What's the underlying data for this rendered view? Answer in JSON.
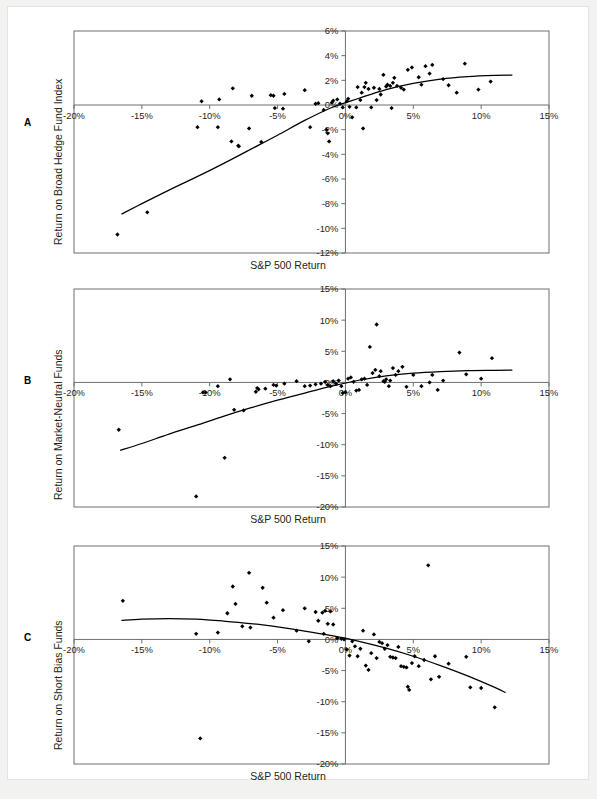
{
  "figure": {
    "background": "#f2f2f1",
    "page_background": "#ffffff",
    "axis_color": "#6d6e71",
    "curve_color": "#000000",
    "point_color": "#000000"
  },
  "panels": [
    {
      "letter": "A",
      "ylabel": "Return on Broad Hedge Fund Index",
      "xlabel": "S&P 500 Return"
    },
    {
      "letter": "B",
      "ylabel": "Return on Market-Neutral Funds",
      "xlabel": "S&P 500 Return"
    },
    {
      "letter": "C",
      "ylabel": "Return on Short Bias Funds",
      "xlabel": "S&P 500 Return"
    }
  ],
  "chart_data": [
    {
      "type": "scatter",
      "panel": "A",
      "title": "",
      "xlabel": "S&P 500 Return",
      "ylabel": "Return on Broad Hedge Fund Index",
      "xlim": [
        -20,
        15
      ],
      "ylim": [
        -12,
        6
      ],
      "xticks": [
        -20,
        -15,
        -10,
        -5,
        0,
        5,
        10,
        15
      ],
      "xticklabels": [
        "-20%",
        "-15%",
        "-10%",
        "-5%",
        "0%",
        "5%",
        "10%",
        "15%"
      ],
      "yticks": [
        6,
        4,
        2,
        0,
        -2,
        -4,
        -6,
        -8,
        -10,
        -12
      ],
      "yticklabels": [
        "6%",
        "4%",
        "2%",
        "0%",
        "-2%",
        "-4%",
        "-6%",
        "-8%",
        "-10%",
        "-12%"
      ],
      "grid": false,
      "legend": null,
      "points": [
        [
          -16.8,
          -10.5
        ],
        [
          -14.6,
          -8.7
        ],
        [
          -10.9,
          -1.8
        ],
        [
          -10.6,
          0.3
        ],
        [
          -9.4,
          -1.8
        ],
        [
          -9.3,
          0.45
        ],
        [
          -8.4,
          -2.95
        ],
        [
          -8.3,
          1.35
        ],
        [
          -7.9,
          -3.3
        ],
        [
          -7.85,
          -3.35
        ],
        [
          -7.1,
          -1.9
        ],
        [
          -6.9,
          0.75
        ],
        [
          -6.2,
          -3.0
        ],
        [
          -5.5,
          0.8
        ],
        [
          -5.3,
          0.75
        ],
        [
          -5.2,
          -0.25
        ],
        [
          -4.6,
          -0.3
        ],
        [
          -4.5,
          0.9
        ],
        [
          -3.0,
          1.2
        ],
        [
          -2.6,
          -1.8
        ],
        [
          -2.2,
          0.1
        ],
        [
          -2.0,
          0.15
        ],
        [
          -1.6,
          -0.4
        ],
        [
          -1.4,
          -2.0
        ],
        [
          -1.3,
          -2.3
        ],
        [
          -1.2,
          -2.95
        ],
        [
          -1.0,
          0.2
        ],
        [
          -0.9,
          0.35
        ],
        [
          -0.6,
          0.45
        ],
        [
          -0.4,
          0.1
        ],
        [
          -0.2,
          -0.2
        ],
        [
          0.1,
          0.3
        ],
        [
          0.2,
          0.5
        ],
        [
          0.3,
          -0.15
        ],
        [
          0.5,
          -1.0
        ],
        [
          0.8,
          -0.2
        ],
        [
          0.9,
          1.45
        ],
        [
          1.1,
          0.4
        ],
        [
          1.2,
          1.0
        ],
        [
          1.3,
          -1.9
        ],
        [
          1.4,
          1.45
        ],
        [
          1.5,
          1.8
        ],
        [
          1.7,
          1.3
        ],
        [
          1.9,
          -0.2
        ],
        [
          2.1,
          1.4
        ],
        [
          2.3,
          0.4
        ],
        [
          2.5,
          1.3
        ],
        [
          2.6,
          0.85
        ],
        [
          2.8,
          2.45
        ],
        [
          3.0,
          1.5
        ],
        [
          3.1,
          1.65
        ],
        [
          3.3,
          1.55
        ],
        [
          3.4,
          -0.25
        ],
        [
          3.5,
          1.8
        ],
        [
          3.6,
          2.2
        ],
        [
          3.8,
          1.55
        ],
        [
          4.1,
          1.4
        ],
        [
          4.3,
          1.25
        ],
        [
          4.6,
          2.85
        ],
        [
          4.9,
          3.05
        ],
        [
          5.4,
          2.25
        ],
        [
          5.6,
          1.65
        ],
        [
          5.9,
          3.15
        ],
        [
          6.2,
          2.55
        ],
        [
          6.4,
          3.25
        ],
        [
          7.2,
          2.1
        ],
        [
          7.6,
          1.6
        ],
        [
          8.2,
          1.0
        ],
        [
          8.8,
          3.35
        ],
        [
          9.8,
          1.25
        ],
        [
          10.7,
          1.9
        ]
      ],
      "fit_curve": {
        "description": "concave upward-sloping fitted curve",
        "x": [
          -16.5,
          -15,
          -13,
          -11,
          -9,
          -7,
          -5,
          -3,
          -1,
          1,
          3,
          5,
          7,
          9,
          11,
          12.3
        ],
        "y": [
          -8.85,
          -8.0,
          -6.9,
          -5.85,
          -4.75,
          -3.6,
          -2.45,
          -1.25,
          -0.2,
          0.55,
          1.25,
          1.75,
          2.1,
          2.3,
          2.4,
          2.42
        ]
      }
    },
    {
      "type": "scatter",
      "panel": "B",
      "title": "",
      "xlabel": "S&P 500 Return",
      "ylabel": "Return on Market-Neutral Funds",
      "xlim": [
        -20,
        15
      ],
      "ylim": [
        -20,
        15
      ],
      "xticks": [
        -20,
        -15,
        -10,
        -5,
        0,
        5,
        10,
        15
      ],
      "xticklabels": [
        "-20%",
        "-15%",
        "-10%",
        "-5%",
        "0%",
        "5%",
        "10%",
        "15%"
      ],
      "yticks": [
        15,
        10,
        5,
        0,
        -5,
        -10,
        -15,
        -20
      ],
      "yticklabels": [
        "15%",
        "10%",
        "5%",
        "0%",
        "-5%",
        "-10%",
        "-15%",
        "-20%"
      ],
      "grid": false,
      "legend": null,
      "points": [
        [
          -16.7,
          -7.6
        ],
        [
          -11.0,
          -18.3
        ],
        [
          -10.5,
          -1.6
        ],
        [
          -10.3,
          -1.6
        ],
        [
          -9.4,
          -0.6
        ],
        [
          -8.9,
          -12.1
        ],
        [
          -8.5,
          0.5
        ],
        [
          -8.2,
          -4.4
        ],
        [
          -7.5,
          -4.5
        ],
        [
          -6.6,
          -1.5
        ],
        [
          -6.5,
          -0.9
        ],
        [
          -6.4,
          -1.1
        ],
        [
          -5.9,
          -1.0
        ],
        [
          -5.3,
          -0.4
        ],
        [
          -5.1,
          -0.5
        ],
        [
          -4.5,
          -0.2
        ],
        [
          -3.6,
          0.2
        ],
        [
          -3.0,
          -0.6
        ],
        [
          -2.6,
          -0.5
        ],
        [
          -2.2,
          -0.3
        ],
        [
          -1.8,
          -0.2
        ],
        [
          -1.5,
          0.1
        ],
        [
          -1.3,
          -0.4
        ],
        [
          -1.1,
          -0.6
        ],
        [
          -0.9,
          0.2
        ],
        [
          -0.7,
          -0.2
        ],
        [
          -0.5,
          0.3
        ],
        [
          -0.3,
          -0.6
        ],
        [
          -0.2,
          -1.7
        ],
        [
          0.0,
          -1.6
        ],
        [
          0.2,
          0.6
        ],
        [
          0.4,
          0.8
        ],
        [
          0.6,
          0.1
        ],
        [
          0.8,
          -1.3
        ],
        [
          1.0,
          -1.2
        ],
        [
          1.2,
          0.5
        ],
        [
          1.4,
          0.6
        ],
        [
          1.6,
          -0.4
        ],
        [
          1.8,
          5.7
        ],
        [
          2.0,
          1.5
        ],
        [
          2.2,
          2.0
        ],
        [
          2.3,
          9.3
        ],
        [
          2.5,
          1.0
        ],
        [
          2.6,
          1.8
        ],
        [
          2.8,
          0.2
        ],
        [
          2.9,
          0.1
        ],
        [
          3.0,
          0.5
        ],
        [
          3.2,
          -0.6
        ],
        [
          3.3,
          0.3
        ],
        [
          3.5,
          2.3
        ],
        [
          3.7,
          1.2
        ],
        [
          3.9,
          1.8
        ],
        [
          4.2,
          2.5
        ],
        [
          4.5,
          -0.7
        ],
        [
          5.0,
          1.2
        ],
        [
          5.6,
          -0.6
        ],
        [
          6.2,
          0.0
        ],
        [
          6.4,
          1.2
        ],
        [
          6.8,
          -1.2
        ],
        [
          7.2,
          0.3
        ],
        [
          8.4,
          4.8
        ],
        [
          8.9,
          1.3
        ],
        [
          10.0,
          0.6
        ],
        [
          10.8,
          3.9
        ]
      ],
      "fit_curve": {
        "description": "concave increasing fitted curve, flattening near +2%",
        "x": [
          -16.6,
          -15,
          -13,
          -11,
          -9,
          -7,
          -5,
          -3,
          -1,
          1,
          3,
          5,
          7,
          9,
          11,
          12.3
        ],
        "y": [
          -10.9,
          -9.8,
          -8.3,
          -6.9,
          -5.45,
          -4.1,
          -2.85,
          -1.7,
          -0.6,
          0.35,
          1.05,
          1.5,
          1.75,
          1.9,
          1.95,
          1.97
        ]
      }
    },
    {
      "type": "scatter",
      "panel": "C",
      "title": "",
      "xlabel": "S&P 500 Return",
      "ylabel": "Return on Short Bias Funds",
      "xlim": [
        -20,
        15
      ],
      "ylim": [
        -20,
        15
      ],
      "xticks": [
        -20,
        -15,
        -10,
        -5,
        0,
        5,
        10,
        15
      ],
      "xticklabels": [
        "-20%",
        "-15%",
        "-10%",
        "-5%",
        "0%",
        "5%",
        "10%",
        "15%"
      ],
      "yticks": [
        15,
        10,
        5,
        0,
        -5,
        -10,
        -15,
        -20
      ],
      "yticklabels": [
        "15%",
        "10%",
        "5%",
        "0%",
        "-5%",
        "-10%",
        "-15%",
        "-20%"
      ],
      "grid": false,
      "legend": null,
      "points": [
        [
          -16.4,
          6.2
        ],
        [
          -11.0,
          0.9
        ],
        [
          -10.7,
          -15.9
        ],
        [
          -9.4,
          1.1
        ],
        [
          -8.7,
          4.2
        ],
        [
          -8.3,
          8.5
        ],
        [
          -8.1,
          5.7
        ],
        [
          -7.6,
          2.1
        ],
        [
          -7.1,
          10.7
        ],
        [
          -7.0,
          1.9
        ],
        [
          -6.1,
          8.3
        ],
        [
          -5.8,
          5.9
        ],
        [
          -5.3,
          3.5
        ],
        [
          -4.6,
          4.7
        ],
        [
          -3.6,
          1.4
        ],
        [
          -3.0,
          5.0
        ],
        [
          -2.7,
          -0.3
        ],
        [
          -2.2,
          4.4
        ],
        [
          -2.0,
          3.0
        ],
        [
          -1.7,
          4.3
        ],
        [
          -1.6,
          0.9
        ],
        [
          -1.5,
          4.6
        ],
        [
          -1.3,
          2.5
        ],
        [
          -1.1,
          4.5
        ],
        [
          -0.9,
          2.4
        ],
        [
          -0.6,
          0.2
        ],
        [
          -0.3,
          0.1
        ],
        [
          -0.1,
          0.0
        ],
        [
          0.1,
          -1.6
        ],
        [
          0.3,
          -2.6
        ],
        [
          0.5,
          -0.3
        ],
        [
          0.7,
          -1.1
        ],
        [
          0.9,
          -2.7
        ],
        [
          1.1,
          -1.5
        ],
        [
          1.3,
          1.4
        ],
        [
          1.5,
          -4.2
        ],
        [
          1.7,
          -4.9
        ],
        [
          1.9,
          -2.2
        ],
        [
          2.1,
          0.8
        ],
        [
          2.3,
          -3.0
        ],
        [
          2.5,
          -0.4
        ],
        [
          2.7,
          -0.6
        ],
        [
          2.9,
          -1.5
        ],
        [
          3.1,
          -0.9
        ],
        [
          3.3,
          -2.8
        ],
        [
          3.5,
          -2.9
        ],
        [
          3.7,
          -3.0
        ],
        [
          3.9,
          -1.2
        ],
        [
          4.1,
          -4.3
        ],
        [
          4.3,
          -4.4
        ],
        [
          4.5,
          -4.5
        ],
        [
          4.6,
          -7.6
        ],
        [
          4.7,
          -8.1
        ],
        [
          4.9,
          -3.8
        ],
        [
          5.1,
          -2.7
        ],
        [
          5.4,
          -4.3
        ],
        [
          5.8,
          -3.3
        ],
        [
          6.1,
          11.9
        ],
        [
          6.3,
          -6.4
        ],
        [
          6.6,
          -2.7
        ],
        [
          6.9,
          -6.0
        ],
        [
          7.6,
          -3.9
        ],
        [
          8.9,
          -2.8
        ],
        [
          9.2,
          -7.7
        ],
        [
          10.0,
          -7.8
        ],
        [
          11.0,
          -10.9
        ]
      ],
      "fit_curve": {
        "description": "concave decreasing fitted curve, steepening to the right",
        "x": [
          -16.5,
          -15,
          -13,
          -11,
          -9,
          -7,
          -5,
          -3,
          -1,
          1,
          3,
          5,
          7,
          9,
          11,
          11.8
        ],
        "y": [
          3.05,
          3.25,
          3.35,
          3.25,
          2.95,
          2.55,
          2.0,
          1.35,
          0.6,
          -0.3,
          -1.4,
          -2.7,
          -4.2,
          -5.85,
          -7.7,
          -8.55
        ]
      }
    }
  ]
}
